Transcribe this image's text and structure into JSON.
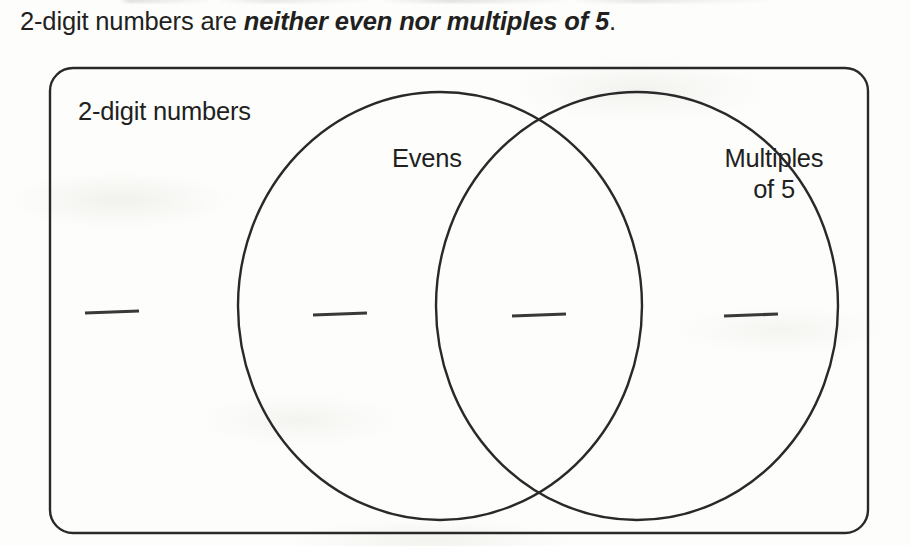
{
  "worksheet": {
    "question": {
      "lead_text": "2-digit numbers are ",
      "emphasis_text": "neither even nor multiples of 5",
      "trailing_text": "."
    },
    "diagram": {
      "type": "venn-two-set-with-universe",
      "universe_label": "2-digit numbers",
      "sets": [
        {
          "id": "evens",
          "label": "Evens"
        },
        {
          "id": "multiples-of-5",
          "label": "Multiples\nof 5"
        }
      ],
      "regions": [
        {
          "id": "outside-both",
          "label": "",
          "answer": ""
        },
        {
          "id": "evens-only",
          "label": "",
          "answer": ""
        },
        {
          "id": "intersection",
          "label": "",
          "answer": ""
        },
        {
          "id": "multiples-only",
          "label": "",
          "answer": ""
        }
      ],
      "answer_blanks_count": 4
    },
    "colors": {
      "ink": "#2a2828",
      "text": "#221f1f",
      "paper": "#fdfdfb"
    }
  }
}
